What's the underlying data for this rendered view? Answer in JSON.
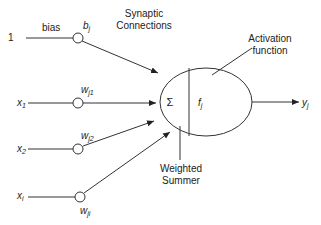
{
  "diagram": {
    "inputs": [
      {
        "label": "1",
        "weight": "b",
        "weight_sub": "j",
        "extra_label": "bias"
      },
      {
        "label": "x",
        "label_sub": "1",
        "weight": "w",
        "weight_sub": "j1"
      },
      {
        "label": "x",
        "label_sub": "2",
        "weight": "w",
        "weight_sub": "j2"
      },
      {
        "label": "x",
        "label_sub": "i",
        "weight": "w",
        "weight_sub": "ji"
      }
    ],
    "annotations": {
      "synaptic_line1": "Synaptic",
      "synaptic_line2": "Connections",
      "activation_line1": "Activation",
      "activation_line2": "function",
      "summer_line1": "Weighted",
      "summer_line2": "Summer"
    },
    "neuron": {
      "sum_symbol": "Σ",
      "function_symbol": "f",
      "function_sub": "j"
    },
    "output": {
      "label": "y",
      "label_sub": "j"
    },
    "colors": {
      "line": "#333333",
      "text": "#222222",
      "background": "#ffffff"
    }
  }
}
